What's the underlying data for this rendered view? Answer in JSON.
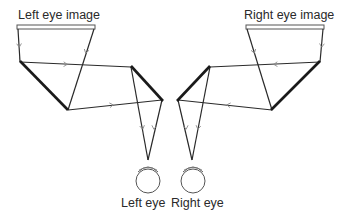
{
  "labels": {
    "left_image": "Left eye image",
    "right_image": "Right eye image",
    "left_eye": "Left eye",
    "right_eye": "Right eye"
  },
  "colors": {
    "stroke": "#2a2a2a",
    "mirror": "#1a1a1a",
    "arrow": "#888888",
    "background": "#ffffff"
  }
}
